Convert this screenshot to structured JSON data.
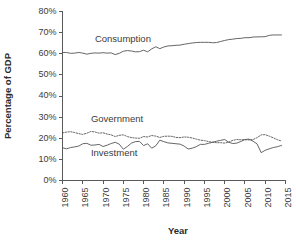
{
  "chart_data": {
    "type": "line",
    "title": "",
    "xlabel": "Year",
    "ylabel": "Percentage of GDP",
    "xlim": [
      1960,
      2015
    ],
    "ylim": [
      0,
      80
    ],
    "grid": false,
    "legend_position": "inline-labels",
    "xticks": [
      "1960",
      "1965",
      "1970",
      "1975",
      "1980",
      "1985",
      "1990",
      "1995",
      "2000",
      "2005",
      "2010",
      "2015"
    ],
    "xtick_values": [
      1960,
      1965,
      1970,
      1975,
      1980,
      1985,
      1990,
      1995,
      2000,
      2005,
      2010,
      2015
    ],
    "yticks": [
      "0%",
      "10%",
      "20%",
      "30%",
      "40%",
      "50%",
      "60%",
      "70%",
      "80%"
    ],
    "ytick_values": [
      0,
      10,
      20,
      30,
      40,
      50,
      60,
      70,
      80
    ],
    "x": [
      1960,
      1961,
      1962,
      1963,
      1964,
      1965,
      1966,
      1967,
      1968,
      1969,
      1970,
      1971,
      1972,
      1973,
      1974,
      1975,
      1976,
      1977,
      1978,
      1979,
      1980,
      1981,
      1982,
      1983,
      1984,
      1985,
      1986,
      1987,
      1988,
      1989,
      1990,
      1991,
      1992,
      1993,
      1994,
      1995,
      1996,
      1997,
      1998,
      1999,
      2000,
      2001,
      2002,
      2003,
      2004,
      2005,
      2006,
      2007,
      2008,
      2009,
      2010,
      2011,
      2012,
      2013,
      2014
    ],
    "series": [
      {
        "name": "Consumption",
        "style": "solid",
        "color": "#555555",
        "label_x": 1968,
        "label_y": 65.5,
        "values": [
          60.6,
          60.6,
          60.2,
          60.3,
          60.6,
          60.3,
          59.8,
          60.2,
          60.4,
          60.3,
          60.5,
          60.3,
          60.4,
          59.6,
          60.2,
          61.2,
          61.5,
          61.3,
          60.9,
          61.0,
          61.7,
          60.9,
          62.3,
          63.3,
          62.4,
          63.2,
          63.7,
          63.8,
          64.0,
          64.1,
          64.5,
          64.8,
          65.1,
          65.3,
          65.4,
          65.4,
          65.4,
          65.2,
          65.3,
          65.8,
          66.3,
          66.7,
          66.9,
          67.2,
          67.3,
          67.6,
          67.6,
          67.9,
          68.0,
          68.0,
          68.1,
          68.7,
          68.9,
          68.9,
          68.9
        ]
      },
      {
        "name": "Government",
        "style": "dotted",
        "color": "#555555",
        "label_x": 1967,
        "label_y": 27.5,
        "values": [
          22.5,
          22.9,
          23.1,
          22.7,
          22.2,
          21.8,
          22.4,
          23.2,
          23.0,
          22.4,
          22.6,
          22.0,
          21.6,
          20.8,
          21.4,
          21.6,
          20.8,
          20.3,
          20.1,
          20.0,
          20.8,
          20.6,
          21.3,
          21.0,
          20.4,
          20.9,
          21.0,
          20.9,
          20.4,
          20.3,
          20.6,
          20.5,
          20.1,
          19.6,
          19.1,
          18.9,
          18.4,
          18.1,
          17.9,
          17.9,
          17.7,
          18.2,
          19.0,
          19.4,
          19.3,
          19.3,
          19.2,
          19.4,
          20.3,
          21.6,
          21.7,
          21.0,
          20.2,
          19.3,
          18.7
        ]
      },
      {
        "name": "Investment",
        "style": "solid",
        "color": "#555555",
        "label_x": 1967,
        "label_y": 11.5,
        "values": [
          15.5,
          15.0,
          15.6,
          15.9,
          16.3,
          17.4,
          17.6,
          16.7,
          16.8,
          17.1,
          16.1,
          16.7,
          17.5,
          18.1,
          17.2,
          14.8,
          16.1,
          17.7,
          18.4,
          18.5,
          16.5,
          17.4,
          15.3,
          16.4,
          19.1,
          18.4,
          17.8,
          17.6,
          17.4,
          17.2,
          16.3,
          14.9,
          15.3,
          16.0,
          17.1,
          17.1,
          17.6,
          18.1,
          18.6,
          19.0,
          19.4,
          18.1,
          17.5,
          17.7,
          18.5,
          19.4,
          19.6,
          18.6,
          17.3,
          13.2,
          14.3,
          15.0,
          15.6,
          16.0,
          16.6
        ]
      }
    ]
  },
  "axis": {
    "y_title": "Percentage of GDP",
    "x_title": "Year"
  }
}
